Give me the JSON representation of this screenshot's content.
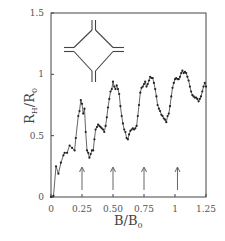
{
  "chart_data": {
    "type": "scatter",
    "title": "",
    "xlabel": "B/B0",
    "ylabel": "RH/R0",
    "xlim": [
      0,
      1.25
    ],
    "ylim": [
      0,
      1.5
    ],
    "grid": false,
    "legend": null,
    "x_ticks": [
      {
        "value": 0,
        "label": "0"
      },
      {
        "value": 0.25,
        "label": "0.25"
      },
      {
        "value": 0.5,
        "label": "0.50"
      },
      {
        "value": 0.75,
        "label": "0.75"
      },
      {
        "value": 1.0,
        "label": "1"
      },
      {
        "value": 1.25,
        "label": "1.25"
      }
    ],
    "y_ticks": [
      {
        "value": 0,
        "label": "0"
      },
      {
        "value": 0.5,
        "label": "0.5"
      },
      {
        "value": 1.0,
        "label": "1"
      },
      {
        "value": 1.5,
        "label": "1.5"
      }
    ],
    "annotations": {
      "arrows_at_x": [
        0.25,
        0.5,
        0.75,
        1.02
      ],
      "inset": "cross-junction geometry (four leads meeting a diamond-shaped cavity)"
    },
    "series": [
      {
        "name": "measured",
        "style": "points+line",
        "x": [
          0,
          0.02,
          0.04,
          0.06,
          0.08,
          0.1,
          0.11,
          0.13,
          0.15,
          0.17,
          0.19,
          0.2,
          0.22,
          0.23,
          0.24,
          0.25,
          0.26,
          0.27,
          0.28,
          0.29,
          0.3,
          0.31,
          0.32,
          0.33,
          0.34,
          0.35,
          0.36,
          0.37,
          0.38,
          0.39,
          0.4,
          0.41,
          0.42,
          0.43,
          0.44,
          0.45,
          0.46,
          0.47,
          0.48,
          0.49,
          0.5,
          0.51,
          0.52,
          0.53,
          0.54,
          0.55,
          0.56,
          0.57,
          0.58,
          0.59,
          0.6,
          0.61,
          0.62,
          0.63,
          0.64,
          0.65,
          0.66,
          0.67,
          0.68,
          0.69,
          0.7,
          0.71,
          0.72,
          0.73,
          0.74,
          0.75,
          0.76,
          0.77,
          0.78,
          0.79,
          0.8,
          0.81,
          0.82,
          0.83,
          0.84,
          0.85,
          0.86,
          0.87,
          0.88,
          0.89,
          0.9,
          0.91,
          0.92,
          0.93,
          0.94,
          0.95,
          0.96,
          0.97,
          0.98,
          0.99,
          1.0,
          1.01,
          1.02,
          1.03,
          1.04,
          1.05,
          1.06,
          1.07,
          1.08,
          1.09,
          1.1,
          1.11,
          1.12,
          1.13,
          1.14,
          1.15,
          1.16,
          1.17,
          1.18,
          1.19,
          1.2,
          1.21,
          1.22,
          1.23,
          1.24,
          1.25
        ],
        "y": [
          0,
          0.01,
          0.25,
          0.19,
          0.28,
          0.34,
          0.36,
          0.36,
          0.42,
          0.4,
          0.38,
          0.48,
          0.66,
          0.7,
          0.79,
          0.76,
          0.68,
          0.72,
          0.53,
          0.38,
          0.36,
          0.32,
          0.35,
          0.38,
          0.38,
          0.47,
          0.55,
          0.57,
          0.59,
          0.58,
          0.57,
          0.56,
          0.55,
          0.53,
          0.58,
          0.65,
          0.73,
          0.8,
          0.86,
          0.88,
          0.94,
          0.9,
          0.88,
          0.91,
          0.88,
          0.84,
          0.74,
          0.66,
          0.6,
          0.55,
          0.53,
          0.48,
          0.47,
          0.51,
          0.54,
          0.55,
          0.56,
          0.55,
          0.56,
          0.58,
          0.66,
          0.75,
          0.85,
          0.89,
          0.9,
          0.92,
          0.94,
          0.9,
          0.92,
          0.95,
          0.98,
          0.97,
          0.97,
          0.93,
          0.88,
          0.82,
          0.75,
          0.72,
          0.7,
          0.67,
          0.66,
          0.64,
          0.63,
          0.61,
          0.66,
          0.68,
          0.74,
          0.82,
          0.89,
          0.93,
          0.96,
          0.97,
          0.96,
          0.96,
          0.98,
          1.01,
          1.03,
          1.01,
          1.02,
          1.01,
          0.98,
          0.95,
          0.9,
          0.86,
          0.83,
          0.82,
          0.81,
          0.81,
          0.8,
          0.78,
          0.8,
          0.82,
          0.86,
          0.9,
          0.93,
          0.9
        ]
      }
    ]
  },
  "labels": {
    "xlabel_main": "B/B",
    "xlabel_sub": "0",
    "ylabel_main": "R",
    "ylabel_sub1": "H",
    "ylabel_slash": "/R",
    "ylabel_sub2": "0"
  },
  "colors": {
    "frame": "#444444",
    "points": "#222222",
    "curve": "#555555"
  }
}
